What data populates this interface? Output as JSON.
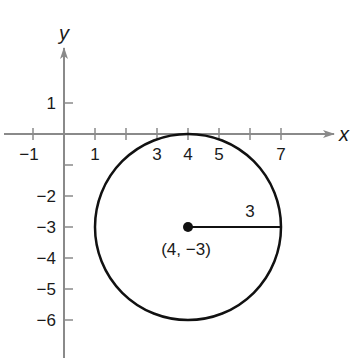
{
  "diagram": {
    "type": "coordinate-plane-circle",
    "axes": {
      "x_label": "x",
      "y_label": "y",
      "x_ticks": [
        -1,
        1,
        2,
        3,
        4,
        5,
        6,
        7
      ],
      "x_tick_labels": [
        "−1",
        "1",
        "3",
        "4",
        "5",
        "7"
      ],
      "x_tick_label_values": [
        -1,
        1,
        3,
        4,
        5,
        7
      ],
      "y_ticks": [
        1,
        -1,
        -2,
        -3,
        -4,
        -5,
        -6
      ],
      "y_tick_labels": [
        "1",
        "−2",
        "−3",
        "−4",
        "−5",
        "−6"
      ],
      "y_tick_label_values": [
        1,
        -2,
        -3,
        -4,
        -5,
        -6
      ],
      "axis_color": "#8a8a8a"
    },
    "circle": {
      "center": [
        4,
        -3
      ],
      "radius": 3,
      "color": "#111111"
    },
    "center_point": {
      "label": "(4, −3)"
    },
    "radius_segment": {
      "from": [
        4,
        -3
      ],
      "to": [
        7,
        -3
      ],
      "label": "3"
    }
  }
}
